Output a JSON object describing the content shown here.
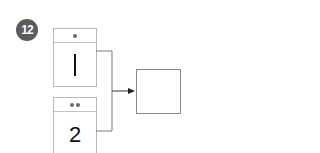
{
  "problem": {
    "number": "12",
    "badge_color": "#5b5b5b"
  },
  "cards": [
    {
      "dots": 1,
      "value": "1"
    },
    {
      "dots": 2,
      "value": "2"
    }
  ],
  "answer_box": {
    "value": ""
  },
  "connector": {
    "type": "bracket-arrow",
    "color": "#7a7a7a"
  }
}
